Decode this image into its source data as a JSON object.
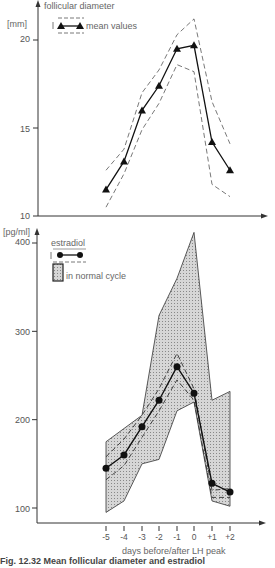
{
  "chart_data": [
    {
      "type": "line",
      "title": "follicular diameter",
      "ylabel": "[mm]",
      "xlabel": "",
      "ylim": [
        10,
        22
      ],
      "yticks": [
        10,
        15,
        20
      ],
      "x": [
        -5,
        -4,
        -3,
        -2,
        -1,
        0,
        1,
        2
      ],
      "legend": [
        {
          "label": "mean values",
          "marker": "triangle",
          "band": "dashed"
        }
      ],
      "series": [
        {
          "name": "mean values",
          "values": [
            11.5,
            13.1,
            16.0,
            17.4,
            19.5,
            19.7,
            14.2,
            12.6
          ]
        },
        {
          "name": "upper bound",
          "values": [
            12.6,
            13.8,
            17.0,
            18.3,
            20.3,
            21.2,
            16.5,
            14.1
          ]
        },
        {
          "name": "lower bound",
          "values": [
            10.5,
            12.4,
            14.9,
            16.4,
            18.6,
            18.2,
            11.8,
            11.1
          ]
        }
      ]
    },
    {
      "type": "line",
      "title": "estradiol",
      "ylabel": "[pg/ml]",
      "xlabel": "days before/after LH peak",
      "ylim": [
        85,
        410
      ],
      "yticks": [
        100,
        200,
        300,
        400
      ],
      "x": [
        -5,
        -4,
        -3,
        -2,
        -1,
        0,
        1,
        2
      ],
      "xticklabels": [
        "-5",
        "-4",
        "-3",
        "-2",
        "-1",
        "0",
        "+1",
        "+2"
      ],
      "legend": [
        {
          "label": "estradiol",
          "marker": "circle",
          "band": "dashed"
        },
        {
          "label": "in normal cycle",
          "marker": "shaded-area"
        }
      ],
      "series": [
        {
          "name": "estradiol",
          "values": [
            145,
            160,
            192,
            222,
            260,
            230,
            128,
            118
          ]
        },
        {
          "name": "estradiol upper",
          "values": [
            158,
            178,
            205,
            235,
            275,
            235,
            120,
            122
          ]
        },
        {
          "name": "estradiol lower",
          "values": [
            132,
            148,
            180,
            210,
            245,
            222,
            112,
            112
          ]
        },
        {
          "name": "normal cycle upper",
          "values": [
            175,
            190,
            205,
            318,
            360,
            412,
            222,
            232
          ]
        },
        {
          "name": "normal cycle lower",
          "values": [
            95,
            108,
            150,
            155,
            210,
            220,
            108,
            102
          ]
        }
      ]
    }
  ],
  "labels": {
    "top_title": "follicular diameter",
    "top_unit": "[mm]",
    "top_legend": "mean values",
    "bottom_unit": "[pg/ml]",
    "bottom_legend_title": "estradiol",
    "bottom_legend_band": "in normal cycle",
    "xlabel": "days before/after LH peak",
    "caption": "Fig. 12.32  Mean follicular diameter and estradiol"
  },
  "ticks": {
    "top": [
      "20",
      "15",
      "10"
    ],
    "bottom": [
      "400",
      "300",
      "200",
      "100"
    ],
    "x": [
      "-5",
      "-4",
      "-3",
      "-2",
      "-1",
      "0",
      "+1",
      "+2"
    ]
  }
}
